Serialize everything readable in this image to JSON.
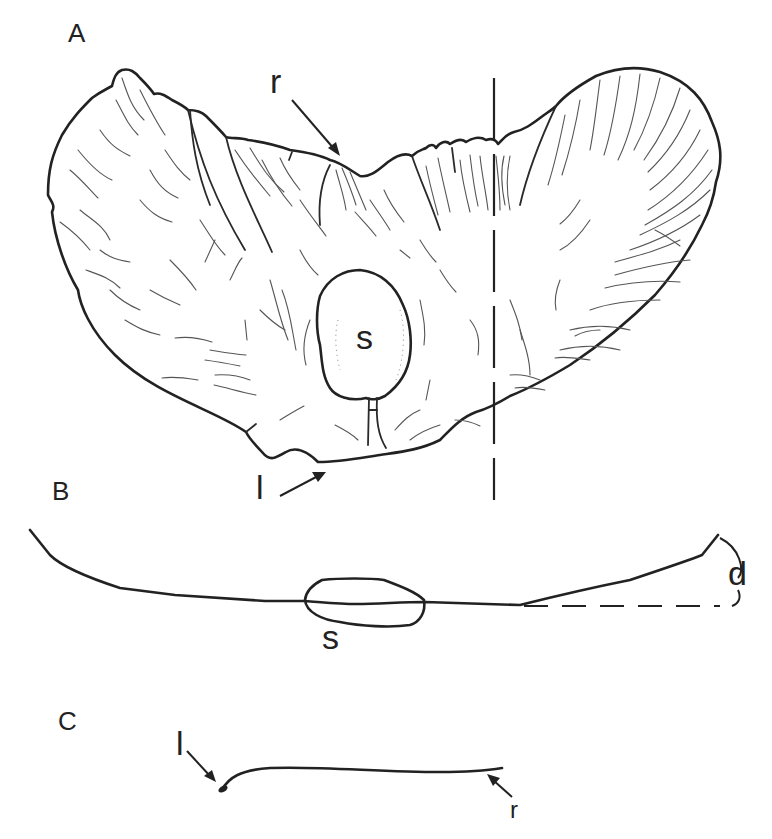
{
  "figure": {
    "panels": [
      {
        "id": "A",
        "label": "A",
        "description": "face view of wing with seed"
      },
      {
        "id": "B",
        "label": "B",
        "description": "cross-section showing wing curvature"
      },
      {
        "id": "C",
        "label": "C",
        "description": "longitudinal section from leading to trailing edge"
      }
    ],
    "annotations": {
      "panelA": {
        "r": "r",
        "s": "s",
        "l": "l"
      },
      "panelB": {
        "s": "s",
        "d": "d"
      },
      "panelC": {
        "l": "l",
        "r": "r"
      }
    },
    "colors": {
      "stroke": "#222222",
      "vein": "#555555",
      "background": "#ffffff"
    }
  }
}
